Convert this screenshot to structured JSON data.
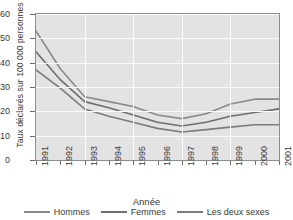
{
  "chart_data": {
    "type": "line",
    "title": "",
    "xlabel": "Année",
    "ylabel": "Taux déclarés sur 100 000 personnes",
    "categories": [
      "1991",
      "1992",
      "1993",
      "1994",
      "1995",
      "1996",
      "1997",
      "1998",
      "1999",
      "2000",
      "2001"
    ],
    "x": [
      1991,
      1992,
      1993,
      1994,
      1995,
      1996,
      1997,
      1998,
      1999,
      2000,
      2001
    ],
    "xlim": [
      1991,
      2001
    ],
    "ylim": [
      0,
      60
    ],
    "yticks": [
      0,
      10,
      20,
      30,
      40,
      50,
      60
    ],
    "grid": true,
    "legend_position": "bottom",
    "series": [
      {
        "name": "Hommes",
        "color": "#8a8a8a",
        "values": [
          53,
          37.5,
          26,
          24,
          22,
          18.5,
          17,
          19,
          23,
          25,
          25
        ]
      },
      {
        "name": "Femmes",
        "color": "#6e6e6e",
        "values": [
          44.5,
          33,
          24,
          21.5,
          18.5,
          15.5,
          14,
          15.5,
          18,
          19.5,
          21
        ]
      },
      {
        "name": "Les deux sexes",
        "color": "#7c7c7c",
        "values": [
          37,
          29.5,
          21,
          18,
          15.5,
          13,
          11.5,
          12.5,
          13.5,
          14.5,
          14.5
        ]
      }
    ]
  },
  "legend": {
    "items": [
      {
        "label": "Hommes"
      },
      {
        "label": "Femmes"
      },
      {
        "label": "Les deux sexes"
      }
    ]
  },
  "colors": {
    "plot_background": "#e3e3e3",
    "gridline": "#fbfbfb",
    "axis": "#8d8d8d",
    "text": "#3a3a3a"
  }
}
